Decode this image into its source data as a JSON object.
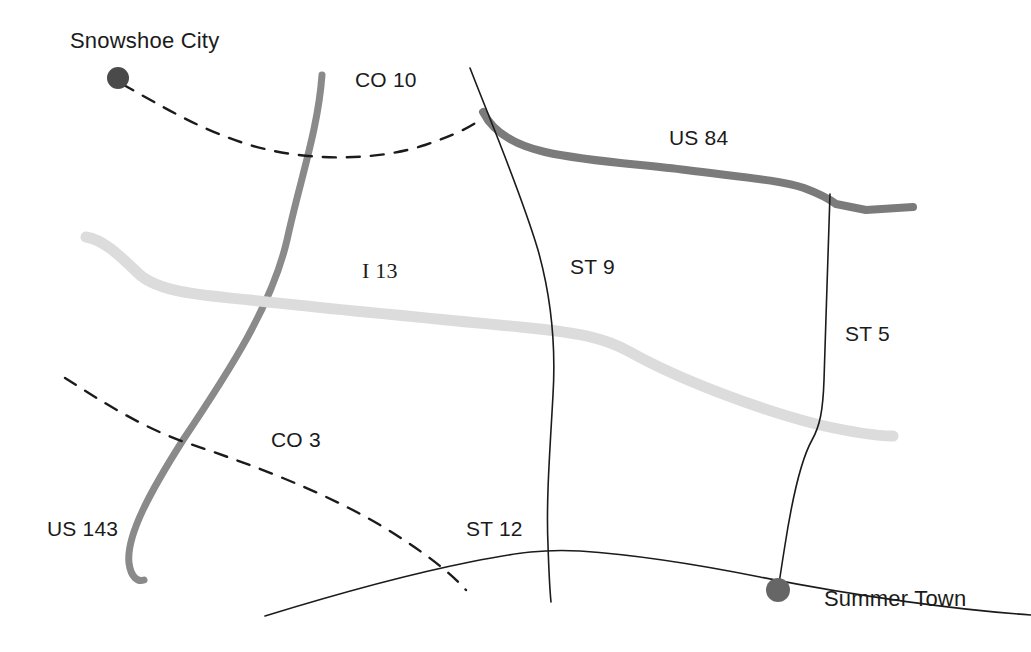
{
  "map": {
    "title": "Road network map",
    "background_color": "#ffffff",
    "width": 1031,
    "height": 652,
    "colors": {
      "highway_dark": "#8a8a8a",
      "highway_us84": "#7b7b7b",
      "interstate_light": "#dcdcdc",
      "county_dashed": "#1b1b1b",
      "state_thin": "#1b1b1b",
      "city_marker_snowshoe": "#4a4a4a",
      "city_marker_summer": "#666666",
      "label_text": "#1b1b1b"
    }
  },
  "cities": [
    {
      "name": "Snowshoe City",
      "label": "Snowshoe City",
      "marker_x": 118,
      "marker_y": 78,
      "marker_radius": 11,
      "label_x": 70,
      "label_y": 28
    },
    {
      "name": "Summer Town",
      "label": "Summer Town",
      "marker_x": 778,
      "marker_y": 590,
      "marker_radius": 12,
      "label_x": 824,
      "label_y": 586
    }
  ],
  "routes": [
    {
      "id": "us-143",
      "label": "US 143",
      "type": "highway",
      "style": "thick-gray",
      "color": "#8a8a8a",
      "width": 7,
      "dashed": false,
      "label_x": 47,
      "label_y": 517,
      "path": "M 322 75 C 318 130, 300 180, 287 240 C 272 305, 230 370, 183 440 C 150 492, 126 536, 129 563 C 131 578, 138 582, 144 580"
    },
    {
      "id": "us-84",
      "label": "US 84",
      "type": "highway",
      "style": "thick-gray",
      "color": "#7b7b7b",
      "width": 8,
      "dashed": false,
      "label_x": 669,
      "label_y": 126,
      "path": "M 483 112 C 492 130, 510 144, 545 152 C 590 162, 640 164, 686 170 C 740 177, 780 180, 804 188 C 820 194, 828 198, 836 204 L 866 210 L 913 207"
    },
    {
      "id": "i-13",
      "label": "I 13",
      "type": "interstate",
      "style": "thick-light",
      "color": "#dcdcdc",
      "width": 11,
      "dashed": false,
      "label_x": 362,
      "label_y": 258,
      "path": "M 86 237 C 105 240, 122 258, 140 275 C 160 292, 200 295, 250 300 C 330 309, 450 320, 530 328 C 580 333, 605 338, 630 352 C 680 380, 760 410, 820 425 C 860 434, 880 436, 893 436"
    },
    {
      "id": "co-10",
      "label": "CO 10",
      "type": "county",
      "style": "dashed",
      "color": "#1b1b1b",
      "width": 2.4,
      "dashed": true,
      "label_x": 355,
      "label_y": 68,
      "path": "M 122 84 C 160 105, 200 130, 250 145 C 310 163, 380 160, 425 145 C 455 135, 470 127, 480 120"
    },
    {
      "id": "co-3",
      "label": "CO 3",
      "type": "county",
      "style": "dashed",
      "color": "#1b1b1b",
      "width": 2.4,
      "dashed": true,
      "label_x": 271,
      "label_y": 428,
      "path": "M 65 378 C 100 400, 140 427, 190 444 C 250 464, 320 490, 380 525 C 420 549, 450 572, 466 590"
    },
    {
      "id": "st-9",
      "label": "ST 9",
      "type": "state",
      "style": "thin",
      "color": "#1b1b1b",
      "width": 1.6,
      "dashed": false,
      "label_x": 570,
      "label_y": 255,
      "path": "M 470 68 C 492 125, 520 190, 538 250 C 552 300, 556 345, 553 395 C 550 450, 546 500, 548 545 C 549 575, 550 592, 551 602"
    },
    {
      "id": "st-5",
      "label": "ST 5",
      "type": "state",
      "style": "thin",
      "color": "#1b1b1b",
      "width": 1.6,
      "dashed": false,
      "label_x": 845,
      "label_y": 322,
      "path": "M 830 194 C 828 250, 826 320, 824 380 C 823 410, 820 426, 812 440 C 802 458, 792 500, 785 545 C 781 570, 779 583, 778 592"
    },
    {
      "id": "st-12",
      "label": "ST 12",
      "type": "state",
      "style": "thin",
      "color": "#1b1b1b",
      "width": 1.6,
      "dashed": false,
      "label_x": 466,
      "label_y": 517,
      "path": "M 265 616 C 330 596, 400 576, 470 562 C 520 552, 545 549, 580 551 C 640 555, 700 565, 760 577 C 860 597, 960 610, 1031 615"
    }
  ]
}
